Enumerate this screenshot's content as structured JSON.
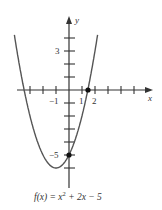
{
  "chart_data": {
    "type": "line",
    "title": "",
    "caption": "f(x) = x² + 2x − 5",
    "caption_parts": {
      "lhs": "f(x) = x",
      "exp": "2",
      "rhs": " + 2x − 5"
    },
    "xlabel": "x",
    "ylabel": "y",
    "function": "x^2 + 2x - 5",
    "xlim": [
      -4.5,
      6.5
    ],
    "ylim": [
      -7.5,
      5.5
    ],
    "x_ticks": [
      -4,
      -3,
      -2,
      -1,
      1,
      2,
      3,
      4,
      5
    ],
    "y_ticks": [
      -6,
      -5,
      -4,
      -3,
      -2,
      -1,
      1,
      2,
      3,
      4
    ],
    "tick_labels": {
      "x": [
        {
          "value": -1,
          "text": "−1"
        },
        {
          "value": 1,
          "text": "1"
        },
        {
          "value": 2,
          "text": "2"
        }
      ],
      "y": [
        {
          "value": 3,
          "text": "3"
        },
        {
          "value": -5,
          "text": "−5"
        }
      ]
    },
    "marked_points": [
      {
        "x": 1.45,
        "y": 0,
        "label": "x-intercept"
      },
      {
        "x": 0,
        "y": -5,
        "label": "y-intercept"
      }
    ],
    "vertex": {
      "x": -1,
      "y": -6
    },
    "grid": false,
    "line_color": "#555555",
    "axis_color": "#333333"
  }
}
